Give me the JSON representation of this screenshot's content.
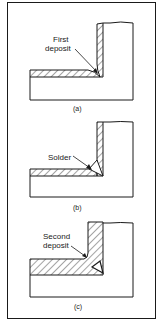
{
  "figure": {
    "panels": [
      {
        "id": "a",
        "caption": "(a)",
        "label_lines": [
          "First",
          "deposit"
        ]
      },
      {
        "id": "b",
        "caption": "(b)",
        "label_lines": [
          "Solder"
        ]
      },
      {
        "id": "c",
        "caption": "(c)",
        "label_lines": [
          "Second",
          "deposit"
        ]
      }
    ]
  },
  "colors": {
    "ink": "#1a1a1a",
    "paper": "#ffffff"
  }
}
